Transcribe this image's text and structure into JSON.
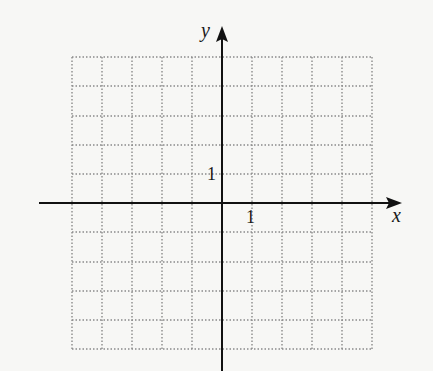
{
  "diagram": {
    "type": "coordinate-grid",
    "axes": {
      "x_label": "x",
      "y_label": "y"
    },
    "ticks": {
      "x_unit_label": "1",
      "y_unit_label": "1"
    },
    "grid": {
      "x_min": -5,
      "x_max": 5,
      "y_min": -5,
      "y_max": 5,
      "step": 1,
      "style": "dotted"
    },
    "colors": {
      "axis": "#111111",
      "grid": "#888888",
      "background": "#f7f7f5"
    }
  }
}
